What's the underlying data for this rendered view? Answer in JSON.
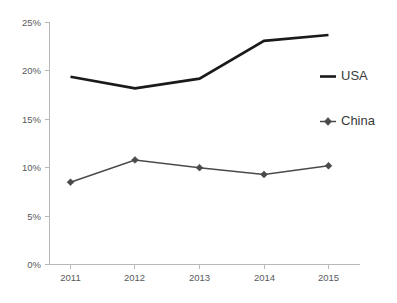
{
  "chart_data": {
    "type": "line",
    "title": "",
    "subtitle": "",
    "xlabel": "",
    "ylabel": "",
    "categories": [
      "2011",
      "2012",
      "2013",
      "2014",
      "2015"
    ],
    "x": [
      2011,
      2012,
      2013,
      2014,
      2015
    ],
    "series": [
      {
        "name": "USA",
        "values": [
          19.4,
          18.2,
          19.2,
          23.1,
          23.7
        ],
        "color": "#1a1a1a",
        "marker": "none",
        "line_width": 2.6
      },
      {
        "name": "China",
        "values": [
          8.5,
          10.8,
          10.0,
          9.3,
          10.2
        ],
        "color": "#4a4a4a",
        "marker": "diamond",
        "line_width": 1.5
      }
    ],
    "ylim": [
      0,
      25
    ],
    "yticks": [
      0,
      5,
      10,
      15,
      20,
      25
    ],
    "ytick_labels": [
      "0%",
      "5%",
      "10%",
      "15%",
      "20%",
      "25%"
    ],
    "xtick_labels": [
      "2011",
      "2012",
      "2013",
      "2014",
      "2015"
    ],
    "grid": false,
    "legend_position": "right",
    "value_suffix": "%",
    "background_color": "#ffffff",
    "axis_color": "#b8b8b8",
    "tick_label_color": "#58595b"
  },
  "legend": {
    "entries": [
      {
        "label": "USA",
        "swatch": "line-swatch"
      },
      {
        "label": "China",
        "swatch": "line-diamond-swatch"
      }
    ]
  },
  "axes": {
    "y": {
      "labels": [
        "25%",
        "20%",
        "15%",
        "10%",
        "5%",
        "0%"
      ]
    },
    "x": {
      "labels": [
        "2011",
        "2012",
        "2013",
        "2014",
        "2015"
      ]
    }
  }
}
